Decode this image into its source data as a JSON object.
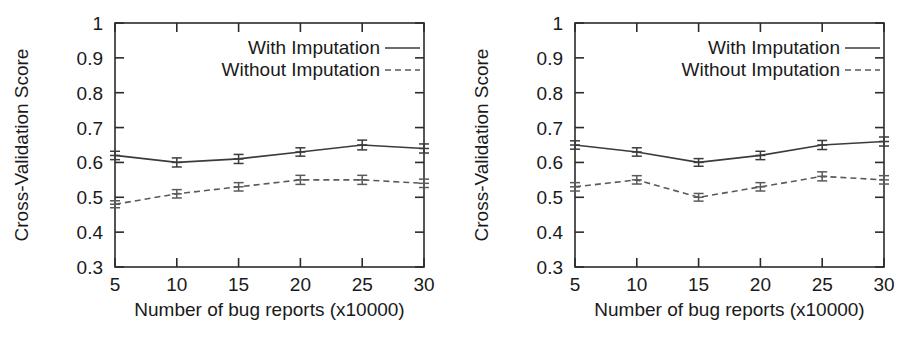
{
  "figure": {
    "background": "#ffffff",
    "panel_count": 2
  },
  "chart_data": [
    {
      "type": "line",
      "panel": "left",
      "title": "",
      "xlabel": "Number of bug reports (x10000)",
      "ylabel": "Cross-Validation Score",
      "x": [
        5,
        10,
        15,
        20,
        25,
        30
      ],
      "xticklabels": [
        "5",
        "10",
        "15",
        "20",
        "25",
        "30"
      ],
      "yticklabels": [
        "0.3",
        "0.4",
        "0.5",
        "0.6",
        "0.7",
        "0.8",
        "0.9",
        "1"
      ],
      "yticks": [
        0.3,
        0.4,
        0.5,
        0.6,
        0.7,
        0.8,
        0.9,
        1.0
      ],
      "xlim": [
        5,
        30
      ],
      "ylim": [
        0.3,
        1.0
      ],
      "grid": false,
      "legend_position": "top-center",
      "series": [
        {
          "name": "With Imputation",
          "style": "solid",
          "color": "#3b3b3b",
          "values": [
            0.62,
            0.6,
            0.61,
            0.63,
            0.65,
            0.64
          ],
          "errors": [
            0.012,
            0.013,
            0.013,
            0.012,
            0.014,
            0.013
          ]
        },
        {
          "name": "Without Imputation",
          "style": "dashed",
          "color": "#5a5a5a",
          "values": [
            0.48,
            0.51,
            0.53,
            0.55,
            0.55,
            0.54
          ],
          "errors": [
            0.01,
            0.012,
            0.012,
            0.013,
            0.013,
            0.012
          ]
        }
      ]
    },
    {
      "type": "line",
      "panel": "right",
      "title": "",
      "xlabel": "Number of bug reports (x10000)",
      "ylabel": "Cross-Validation Score",
      "x": [
        5,
        10,
        15,
        20,
        25,
        30
      ],
      "xticklabels": [
        "5",
        "10",
        "15",
        "20",
        "25",
        "30"
      ],
      "yticklabels": [
        "0.3",
        "0.4",
        "0.5",
        "0.6",
        "0.7",
        "0.8",
        "0.9",
        "1"
      ],
      "yticks": [
        0.3,
        0.4,
        0.5,
        0.6,
        0.7,
        0.8,
        0.9,
        1.0
      ],
      "xlim": [
        5,
        30
      ],
      "ylim": [
        0.3,
        1.0
      ],
      "grid": false,
      "legend_position": "top-center",
      "series": [
        {
          "name": "With Imputation",
          "style": "solid",
          "color": "#3b3b3b",
          "values": [
            0.65,
            0.63,
            0.6,
            0.62,
            0.65,
            0.66
          ],
          "errors": [
            0.012,
            0.012,
            0.011,
            0.012,
            0.013,
            0.013
          ]
        },
        {
          "name": "Without Imputation",
          "style": "dashed",
          "color": "#5a5a5a",
          "values": [
            0.53,
            0.55,
            0.5,
            0.53,
            0.56,
            0.55
          ],
          "errors": [
            0.012,
            0.012,
            0.011,
            0.012,
            0.013,
            0.012
          ]
        }
      ]
    }
  ]
}
